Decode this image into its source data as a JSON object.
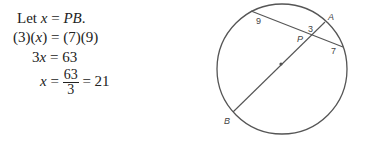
{
  "solution": {
    "line1": {
      "prefix": "Let ",
      "var": "x",
      "eq": " = ",
      "rhs": "PB",
      "suffix": "."
    },
    "line2": {
      "lhs": "(3)(",
      "var": "x",
      "lhs_end": ")",
      "eq": " = ",
      "rhs": "(7)(9)"
    },
    "line3": {
      "coef": "3",
      "var": "x",
      "eq": " = ",
      "rhs": "63"
    },
    "line4": {
      "var": "x",
      "eq": " = ",
      "numerator": "63",
      "denominator": "3",
      "eq2": " = ",
      "result": "21"
    }
  },
  "diagram": {
    "labels": {
      "A": "A",
      "B": "B",
      "P": "P"
    },
    "segments": {
      "left_chord": "9",
      "PA": "3",
      "right_chord": "7"
    },
    "colors": {
      "stroke": "#555555"
    }
  }
}
